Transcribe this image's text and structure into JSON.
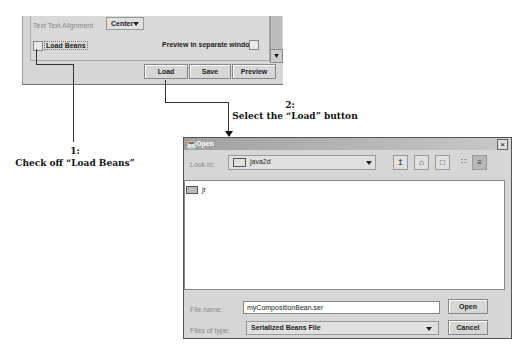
{
  "top_panel": {
    "alignment_label": "Text Text Alignment",
    "alignment_value": "Center",
    "load_beans_label": "Load Beans",
    "load_beans_checked": false,
    "preview_label": "Preview in separate windows",
    "preview_checked": false,
    "buttons": [
      "Load",
      "Save",
      "Preview"
    ]
  },
  "annotations": {
    "step1_num": "1:",
    "step1_text": "Check off “Load Beans”",
    "step2_num": "2:",
    "step2_text": "Select the “Load” button"
  },
  "dialog": {
    "title": "Open",
    "close_glyph": "×",
    "look_in_label": "Look in:",
    "look_in_value": "java2d",
    "files": [
      {
        "name": "jr",
        "type": "folder"
      }
    ],
    "file_name_label": "File name:",
    "file_name_value": "myCompositionBean.ser",
    "file_type_label": "Files of type:",
    "file_type_value": "Serialized Beans File",
    "open_label": "Open",
    "cancel_label": "Cancel",
    "toolbar_icons": [
      "up-folder-icon",
      "home-icon",
      "new-folder-icon",
      "list-view-icon",
      "details-view-icon"
    ]
  }
}
